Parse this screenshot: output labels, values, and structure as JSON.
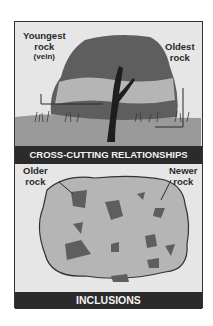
{
  "panels": [
    {
      "title": "CROSS-CUTTING RELATIONSHIPS",
      "labels": {
        "youngest_line1": "Youngest",
        "youngest_line2": "rock",
        "youngest_line3": "(vein)",
        "oldest_line1": "Oldest",
        "oldest_line2": "rock"
      }
    },
    {
      "title": "INCLUSIONS",
      "labels": {
        "older_line1": "Older",
        "older_line2": "rock",
        "newer_line1": "Newer",
        "newer_line2": "rock"
      }
    }
  ],
  "colors": {
    "background": "#e6e6e6",
    "banner": "#2b2b2b",
    "rock_dark": "#5e5e5e",
    "rock_light": "#b5b5b5",
    "ground": "#9a9a9a",
    "vein": "#1e1e1e"
  }
}
